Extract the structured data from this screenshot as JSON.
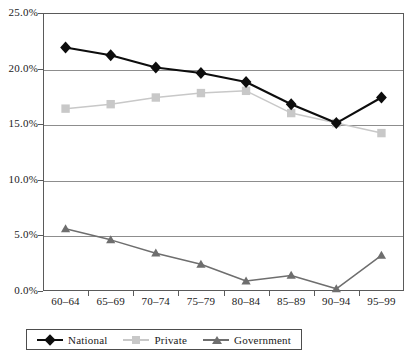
{
  "chart_data": {
    "type": "line",
    "title": "",
    "xlabel": "",
    "ylabel": "",
    "categories": [
      "60–64",
      "65–69",
      "70–74",
      "75–79",
      "80–84",
      "85–89",
      "90–94",
      "95–99"
    ],
    "ylim": [
      0,
      25
    ],
    "y_ticks": [
      0.0,
      5.0,
      10.0,
      15.0,
      20.0,
      25.0
    ],
    "y_tick_labels": [
      "0.0%",
      "5.0%",
      "10.0%",
      "15.0%",
      "20.0%",
      "25.0%"
    ],
    "grid": "horizontal",
    "legend_position": "bottom-left",
    "series": [
      {
        "name": "National",
        "marker": "diamond",
        "color": "#0d0d0d",
        "values": [
          21.9,
          21.2,
          20.1,
          19.6,
          18.8,
          16.8,
          15.1,
          17.4
        ]
      },
      {
        "name": "Private",
        "marker": "square",
        "color": "#c8c8c8",
        "values": [
          16.4,
          16.8,
          17.4,
          17.8,
          18.0,
          16.0,
          15.1,
          14.2
        ]
      },
      {
        "name": "Government",
        "marker": "triangle",
        "color": "#6e6e6e",
        "values": [
          5.6,
          4.6,
          3.4,
          2.4,
          0.9,
          1.4,
          0.2,
          3.2
        ]
      }
    ]
  },
  "axis": {
    "frame_color": "#5a5a5a",
    "grid_color": "#8d8d8d"
  }
}
